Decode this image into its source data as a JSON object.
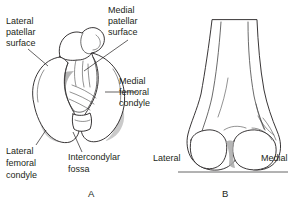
{
  "figure": {
    "ink_color": "#231f20",
    "shade_color": "#a9a9a9"
  },
  "panels": [
    {
      "id": "A",
      "label": "A",
      "view": "inferior view of distal femur",
      "label_x": 88,
      "label_y": 196
    },
    {
      "id": "B",
      "label": "B",
      "view": "anterior view of distal femur",
      "label_x": 222,
      "label_y": 196
    }
  ],
  "labels": {
    "lateral_patellar_surface": {
      "lines": [
        "Lateral",
        "patellar",
        "surface"
      ],
      "line1": "Lateral",
      "line2": "patellar",
      "line3": "surface"
    },
    "medial_patellar_surface": {
      "lines": [
        "Medial",
        "patellar",
        "surface"
      ],
      "line1": "Medial",
      "line2": "patellar",
      "line3": "surface"
    },
    "medial_femoral_condyle": {
      "lines": [
        "Medial",
        "femoral",
        "condyle"
      ],
      "line1": "Medial",
      "line2": "femoral",
      "line3": "condyle"
    },
    "lateral_femoral_condyle": {
      "lines": [
        "Lateral",
        "femoral",
        "condyle"
      ],
      "line1": "Lateral",
      "line2": "femoral",
      "line3": "condyle"
    },
    "intercondylar_fossa": {
      "lines": [
        "Intercondylar",
        "fossa"
      ],
      "line1": "Intercondylar",
      "line2": "fossa"
    },
    "lateral_b": "Lateral",
    "medial_b": "Medial"
  }
}
